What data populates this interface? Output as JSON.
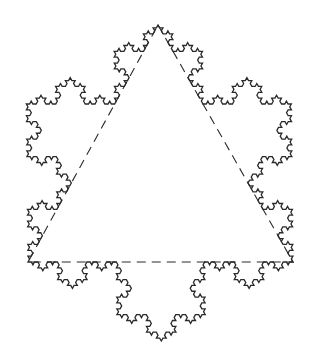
{
  "diagram": {
    "title": "Koch snowflake with inscribed triangle",
    "type": "koch-snowflake",
    "iterations": 4,
    "stroke_color": "#2a2a2a",
    "stroke_width": 1.3,
    "triangle": {
      "vertices": [
        [
          158,
          25
        ],
        [
          293,
          262
        ],
        [
          28,
          262
        ]
      ],
      "stroke_color": "#2a2a2a",
      "stroke_width": 1.1,
      "dash": "9 6"
    },
    "background": "#ffffff"
  }
}
